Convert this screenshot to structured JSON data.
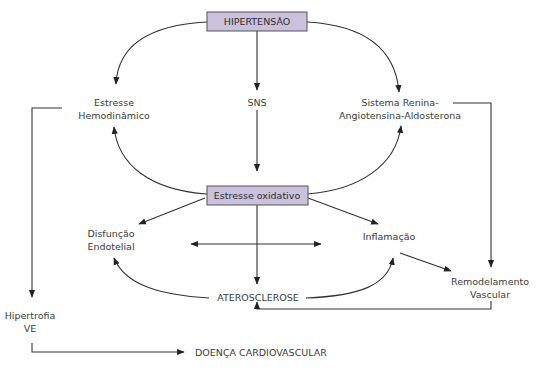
{
  "diagram": {
    "colors": {
      "box_fill": "#c9c1dd",
      "box_stroke": "#555555",
      "line": "#333333",
      "text": "#3c3c3c"
    },
    "nodes": {
      "hipertensao": {
        "label": "HIPERTENSÃO",
        "style": "box"
      },
      "estresse_hemo": {
        "lines": [
          "Estresse",
          "Hemodinâmico"
        ]
      },
      "sns": {
        "label": "SNS"
      },
      "sraa": {
        "lines": [
          "Sistema Renina-",
          "Angiotensina-Aldosterona"
        ]
      },
      "estresse_ox": {
        "label": "Estresse oxidativo",
        "style": "box"
      },
      "disfuncao": {
        "lines": [
          "Disfunção",
          "Endotelial"
        ]
      },
      "inflamacao": {
        "label": "Inflamação"
      },
      "remodelamento": {
        "lines": [
          "Remodelamento",
          "Vascular"
        ]
      },
      "aterosclerose": {
        "label": "ATEROSCLEROSE"
      },
      "hipertrofia": {
        "lines": [
          "Hipertrofia",
          "VE"
        ]
      },
      "doenca": {
        "label": "DOENÇA CARDIOVASCULAR"
      }
    },
    "edges": [
      {
        "from": "hipertensao",
        "to": "estresse_hemo"
      },
      {
        "from": "hipertensao",
        "to": "sns"
      },
      {
        "from": "hipertensao",
        "to": "sraa"
      },
      {
        "from": "sns",
        "to": "estresse_ox"
      },
      {
        "from": "estresse_ox",
        "to": "estresse_hemo"
      },
      {
        "from": "estresse_ox",
        "to": "sraa"
      },
      {
        "from": "estresse_ox",
        "to": "disfuncao"
      },
      {
        "from": "estresse_ox",
        "to": "inflamacao"
      },
      {
        "from": "estresse_ox",
        "to": "aterosclerose"
      },
      {
        "from": "disfuncao",
        "to": "inflamacao",
        "bidirectional": true
      },
      {
        "from": "aterosclerose",
        "to": "disfuncao"
      },
      {
        "from": "aterosclerose",
        "to": "inflamacao"
      },
      {
        "from": "inflamacao",
        "to": "remodelamento"
      },
      {
        "from": "sraa",
        "to": "remodelamento"
      },
      {
        "from": "remodelamento",
        "to": "aterosclerose"
      },
      {
        "from": "estresse_hemo",
        "to": "hipertrofia"
      },
      {
        "from": "hipertrofia",
        "to": "doenca"
      }
    ]
  }
}
